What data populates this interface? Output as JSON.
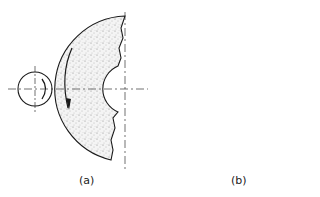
{
  "figure": {
    "panels": [
      {
        "id": "a",
        "label": "(a)",
        "description": "Internal grinding: small circular grinding wheel contacting the outer convex edge of a large stippled half-annulus workpiece, with rotation arrows"
      },
      {
        "id": "b",
        "label": "(b)",
        "description": "Stippled grinding wheel with hub positioned inside a large circle, tangent at the left, with rotation arrows"
      }
    ],
    "colors": {
      "line": "#1a1a1a",
      "stipple": "#888888",
      "background": "#ffffff"
    }
  }
}
